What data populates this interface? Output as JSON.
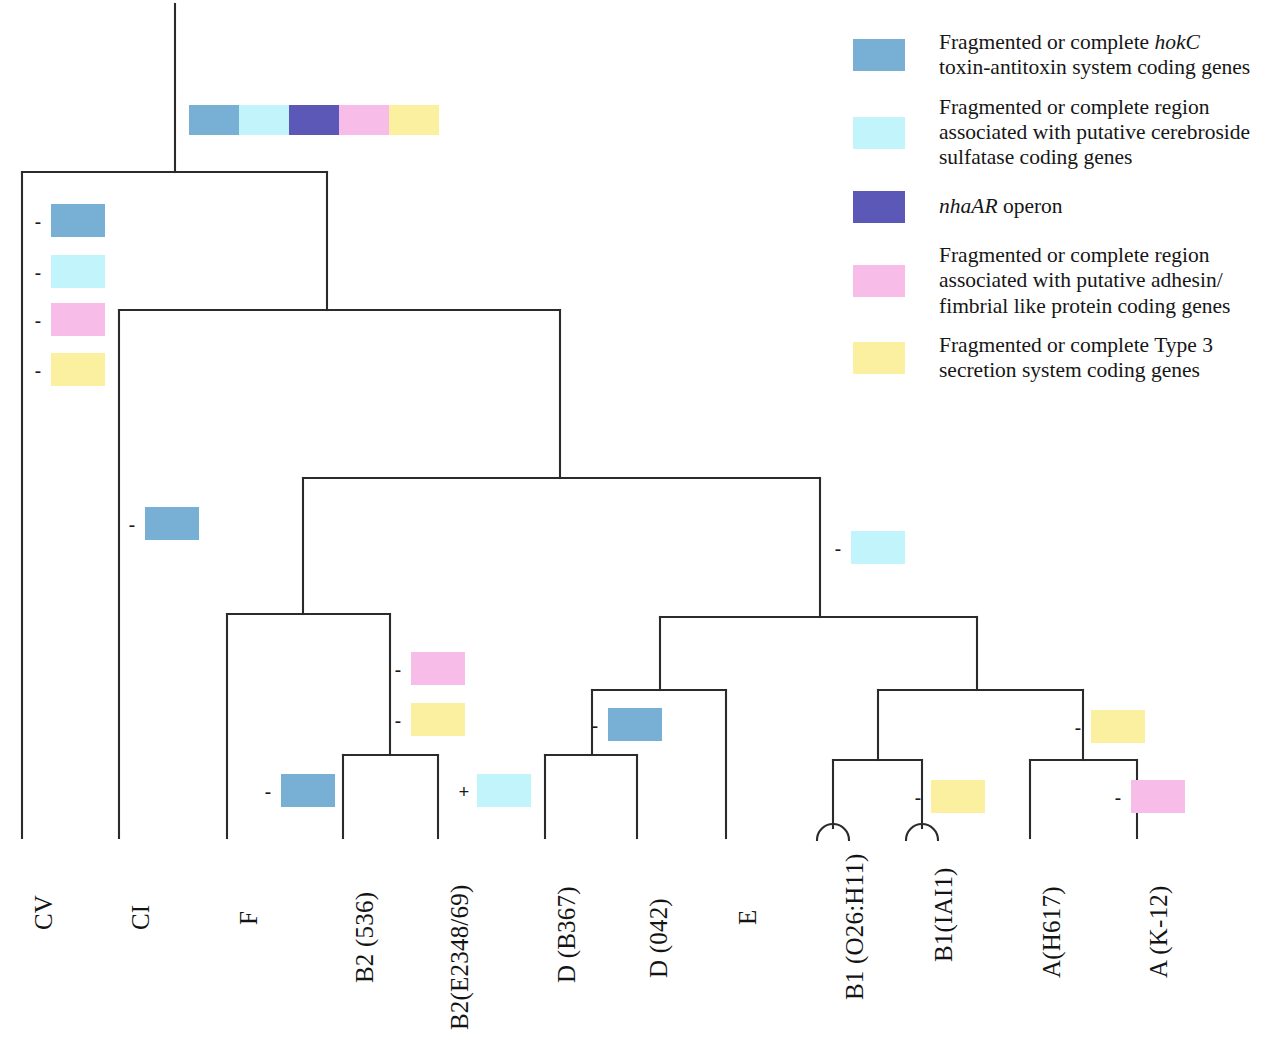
{
  "figure": {
    "type": "phylogenetic-tree-with-gene-presence-markers"
  },
  "colors": {
    "hokC_blue": "#77b0d4",
    "cerebroside_cyan": "#c2f4fb",
    "nhaAR_indigo": "#5c58b8",
    "adhesin_pink": "#f7bce8",
    "t3ss_yellow": "#faf0a0",
    "line": "#2b2b2b"
  },
  "legend": {
    "items": [
      {
        "swatch": "hokC_blue",
        "swatch_name": "legend-swatch-hokc",
        "text_plain": "Fragmented or complete hokC toxin-antitoxin system coding genes",
        "line1_a": "Fragmented or complete ",
        "line1_em": "hokC",
        "line2": "toxin-antitoxin system coding genes"
      },
      {
        "swatch": "cerebroside_cyan",
        "swatch_name": "legend-swatch-cerebroside",
        "text_plain": "Fragmented or complete region associated with putative cerebroside sulfatase coding genes",
        "line1_a": "Fragmented or complete region",
        "line1_em": "",
        "line2": "associated with putative cerebroside",
        "line3": "sulfatase coding genes"
      },
      {
        "swatch": "nhaAR_indigo",
        "swatch_name": "legend-swatch-nhaar",
        "text_plain": "nhaAR operon",
        "line1_a": "",
        "line1_em": "nhaAR",
        "line2": " operon"
      },
      {
        "swatch": "adhesin_pink",
        "swatch_name": "legend-swatch-adhesin",
        "text_plain": "Fragmented or complete region associated with putative adhesin/ fimbrial like protein coding genes",
        "line1_a": "Fragmented or complete region",
        "line1_em": "",
        "line2": "associated with putative adhesin/",
        "line3": "fimbrial like protein coding genes"
      },
      {
        "swatch": "t3ss_yellow",
        "swatch_name": "legend-swatch-t3ss",
        "text_plain": "Fragmented or complete Type 3 secretion system coding genes",
        "line1_a": "Fragmented or complete Type 3",
        "line1_em": "",
        "line2": "secretion system coding genes"
      }
    ]
  },
  "root_bar": {
    "name": "root-gene-content-bar",
    "segments": [
      "hokC_blue",
      "cerebroside_cyan",
      "nhaAR_indigo",
      "adhesin_pink",
      "t3ss_yellow"
    ],
    "x": 189,
    "y": 105
  },
  "leaves": [
    {
      "id": "CV",
      "label": "CV",
      "x": 22,
      "label_x": 30,
      "label_y": 930,
      "tip_y": 838
    },
    {
      "id": "CI",
      "label": "CI",
      "x": 119,
      "label_x": 127,
      "label_y": 930,
      "tip_y": 838
    },
    {
      "id": "F",
      "label": "F",
      "x": 227,
      "label_x": 235,
      "label_y": 925,
      "tip_y": 838
    },
    {
      "id": "B2_536",
      "label": "B2 (536)",
      "x": 343,
      "label_x": 351,
      "label_y": 983,
      "tip_y": 838
    },
    {
      "id": "B2_E234869",
      "label": "B2(E2348/69)",
      "x": 438,
      "label_x": 446,
      "label_y": 1030,
      "tip_y": 838
    },
    {
      "id": "D_B367",
      "label": "D (B367)",
      "x": 545,
      "label_x": 553,
      "label_y": 983,
      "tip_y": 838
    },
    {
      "id": "D_042",
      "label": "D (042)",
      "x": 637,
      "label_x": 645,
      "label_y": 978,
      "tip_y": 838
    },
    {
      "id": "E",
      "label": "E",
      "x": 726,
      "label_x": 734,
      "label_y": 925,
      "tip_y": 838
    },
    {
      "id": "B1_O26H11",
      "label": "B1 (O26:H11)",
      "x": 833,
      "label_x": 841,
      "label_y": 1000,
      "tip_y": 828
    },
    {
      "id": "B1_IAI1",
      "label": "B1(IAI1)",
      "x": 922,
      "label_x": 930,
      "label_y": 962,
      "tip_y": 828
    },
    {
      "id": "A_H617",
      "label": "A(H617)",
      "x": 1030,
      "label_x": 1038,
      "label_y": 978,
      "tip_y": 838
    },
    {
      "id": "A_K12",
      "label": "A (K-12)",
      "x": 1137,
      "label_x": 1145,
      "label_y": 978,
      "tip_y": 838
    }
  ],
  "markers": [
    {
      "name": "marker-cv-hokc",
      "sign": "-",
      "color": "hokC_blue",
      "chip_x": 51,
      "chip_y": 204
    },
    {
      "name": "marker-cv-cerebroside",
      "sign": "-",
      "color": "cerebroside_cyan",
      "chip_x": 51,
      "chip_y": 255
    },
    {
      "name": "marker-cv-adhesin",
      "sign": "-",
      "color": "adhesin_pink",
      "chip_x": 51,
      "chip_y": 303
    },
    {
      "name": "marker-cv-t3ss",
      "sign": "-",
      "color": "t3ss_yellow",
      "chip_x": 51,
      "chip_y": 353
    },
    {
      "name": "marker-ci-hokc",
      "sign": "-",
      "color": "hokC_blue",
      "chip_x": 145,
      "chip_y": 507
    },
    {
      "name": "marker-right-cerebroside",
      "sign": "-",
      "color": "cerebroside_cyan",
      "chip_x": 851,
      "chip_y": 531
    },
    {
      "name": "marker-b2clade-adhesin",
      "sign": "-",
      "color": "adhesin_pink",
      "chip_x": 411,
      "chip_y": 652
    },
    {
      "name": "marker-b2clade-t3ss",
      "sign": "-",
      "color": "t3ss_yellow",
      "chip_x": 411,
      "chip_y": 703
    },
    {
      "name": "marker-f-hokc",
      "sign": "-",
      "color": "hokC_blue",
      "chip_x": 281,
      "chip_y": 774
    },
    {
      "name": "marker-b2-cerebroside",
      "sign": "+",
      "color": "cerebroside_cyan",
      "chip_x": 477,
      "chip_y": 774
    },
    {
      "name": "marker-dclade-hokc",
      "sign": "-",
      "color": "hokC_blue",
      "chip_x": 608,
      "chip_y": 708
    },
    {
      "name": "marker-b1a-t3ss",
      "sign": "-",
      "color": "t3ss_yellow",
      "chip_x": 1091,
      "chip_y": 710
    },
    {
      "name": "marker-b1iai1-t3ss",
      "sign": "-",
      "color": "t3ss_yellow",
      "chip_x": 931,
      "chip_y": 780
    },
    {
      "name": "marker-ak12-adhesin",
      "sign": "-",
      "color": "adhesin_pink",
      "chip_x": 1131,
      "chip_y": 780
    }
  ],
  "tree_edges": {
    "root_stem": {
      "x": 175,
      "y1": 4,
      "y2": 172
    },
    "n_root_h": {
      "y": 172,
      "x1": 22,
      "x2": 327
    },
    "n_root_right_v": {
      "x": 327,
      "y1": 172,
      "y2": 310
    },
    "n1_h": {
      "y": 310,
      "x1": 119,
      "x2": 560
    },
    "n1_right_v": {
      "x": 560,
      "y1": 310,
      "y2": 478
    },
    "n2_h": {
      "y": 478,
      "x1": 303,
      "x2": 820
    },
    "n2_left_v": {
      "x": 303,
      "y1": 478,
      "y2": 614
    },
    "n2_right_v": {
      "x": 820,
      "y1": 478,
      "y2": 617
    },
    "n3_h": {
      "y": 614,
      "x1": 227,
      "x2": 390
    },
    "n3_right_v": {
      "x": 390,
      "y1": 614,
      "y2": 755
    },
    "n4_h": {
      "y": 755,
      "x1": 343,
      "x2": 438
    },
    "n5_h": {
      "y": 617,
      "x1": 660,
      "x2": 977
    },
    "n5_left_v": {
      "x": 660,
      "y1": 617,
      "y2": 690
    },
    "n6_h": {
      "y": 690,
      "x1": 592,
      "x2": 726
    },
    "n6_left_v": {
      "x": 592,
      "y1": 690,
      "y2": 755
    },
    "n7_h": {
      "y": 755,
      "x1": 545,
      "x2": 637
    },
    "n5_right_v": {
      "x": 977,
      "y1": 617,
      "y2": 690
    },
    "n8_h": {
      "y": 690,
      "x1": 878,
      "x2": 1083
    },
    "n8_left_v": {
      "x": 878,
      "y1": 690,
      "y2": 760
    },
    "n9_h": {
      "y": 760,
      "x1": 833,
      "x2": 922
    },
    "n8_right_v": {
      "x": 1083,
      "y1": 690,
      "y2": 760
    },
    "n10_h": {
      "y": 760,
      "x1": 1030,
      "x2": 1137
    }
  }
}
